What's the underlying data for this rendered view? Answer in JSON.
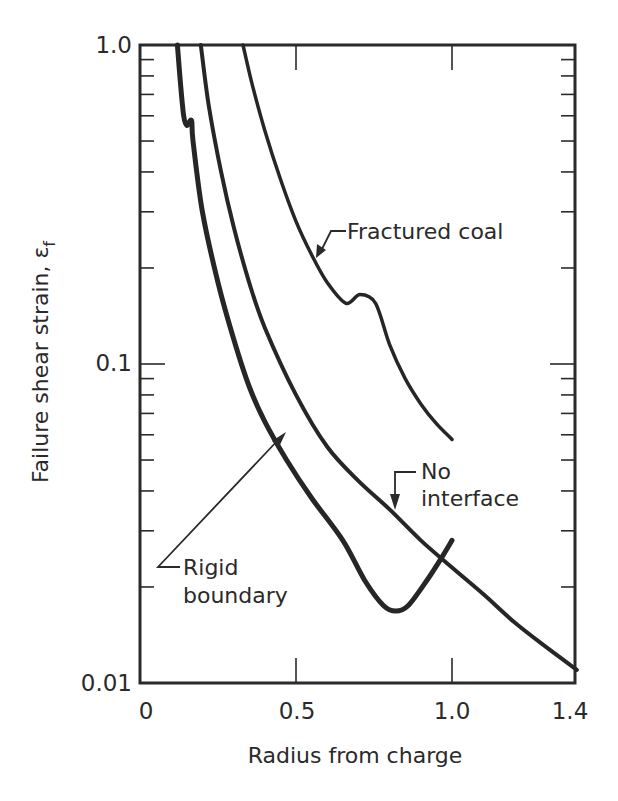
{
  "chart_data": {
    "type": "line",
    "title": "",
    "xlabel": "Radius from charge",
    "ylabel": "Failure shear strain, ε",
    "ylabel_subscript": "f",
    "xscale": "linear",
    "yscale": "log",
    "xlim": [
      0,
      1.4
    ],
    "ylim": [
      0.01,
      1.0
    ],
    "x_ticks": [
      {
        "value": 0,
        "label": "0"
      },
      {
        "value": 0.5,
        "label": "0.5"
      },
      {
        "value": 1.0,
        "label": "1.0"
      },
      {
        "value": 1.4,
        "label": "1.4"
      }
    ],
    "y_ticks": [
      {
        "value": 0.01,
        "label": "0.01"
      },
      {
        "value": 0.1,
        "label": "0.1"
      },
      {
        "value": 1.0,
        "label": "1.0"
      }
    ],
    "grid": false,
    "legend": "none (curves labeled directly)",
    "series": [
      {
        "name": "Rigid boundary",
        "stroke_width": 5,
        "points": [
          [
            0.12,
            1.0
          ],
          [
            0.13,
            0.75
          ],
          [
            0.14,
            0.6
          ],
          [
            0.15,
            0.56
          ],
          [
            0.165,
            0.58
          ],
          [
            0.17,
            0.5
          ],
          [
            0.2,
            0.3
          ],
          [
            0.25,
            0.18
          ],
          [
            0.3,
            0.12
          ],
          [
            0.35,
            0.085
          ],
          [
            0.4,
            0.066
          ],
          [
            0.47,
            0.05
          ],
          [
            0.55,
            0.038
          ],
          [
            0.65,
            0.028
          ],
          [
            0.72,
            0.021
          ],
          [
            0.78,
            0.0175
          ],
          [
            0.82,
            0.0168
          ],
          [
            0.86,
            0.0175
          ],
          [
            0.92,
            0.021
          ],
          [
            0.97,
            0.025
          ],
          [
            1.0,
            0.028
          ]
        ]
      },
      {
        "name": "No interface",
        "stroke_width": 4,
        "points": [
          [
            0.195,
            1.0
          ],
          [
            0.22,
            0.65
          ],
          [
            0.26,
            0.4
          ],
          [
            0.3,
            0.27
          ],
          [
            0.35,
            0.18
          ],
          [
            0.4,
            0.13
          ],
          [
            0.5,
            0.08
          ],
          [
            0.6,
            0.055
          ],
          [
            0.7,
            0.043
          ],
          [
            0.8,
            0.035
          ],
          [
            0.9,
            0.028
          ],
          [
            1.0,
            0.023
          ],
          [
            1.1,
            0.019
          ],
          [
            1.2,
            0.0155
          ],
          [
            1.3,
            0.013
          ],
          [
            1.4,
            0.011
          ]
        ]
      },
      {
        "name": "Fractured coal",
        "stroke_width": 3.5,
        "points": [
          [
            0.33,
            1.0
          ],
          [
            0.36,
            0.75
          ],
          [
            0.4,
            0.54
          ],
          [
            0.45,
            0.38
          ],
          [
            0.5,
            0.28
          ],
          [
            0.55,
            0.22
          ],
          [
            0.6,
            0.18
          ],
          [
            0.66,
            0.155
          ],
          [
            0.705,
            0.165
          ],
          [
            0.755,
            0.155
          ],
          [
            0.8,
            0.115
          ],
          [
            0.85,
            0.09
          ],
          [
            0.9,
            0.075
          ],
          [
            0.95,
            0.065
          ],
          [
            1.0,
            0.058
          ]
        ]
      }
    ],
    "annotations": [
      {
        "text": "Fractured coal",
        "target_series": "Fractured coal",
        "arrow_to": [
          0.565,
          0.215
        ]
      },
      {
        "text": "No interface",
        "lines": [
          "No",
          "interface"
        ],
        "target_series": "No interface",
        "arrow_to": [
          0.82,
          0.034
        ]
      },
      {
        "text": "Rigid boundary",
        "lines": [
          "Rigid",
          "boundary"
        ],
        "target_series": "Rigid boundary",
        "arrow_to": [
          0.47,
          0.058
        ]
      }
    ]
  },
  "labels": {
    "x_axis_title": "Radius from charge",
    "y_axis_title": "Failure shear strain, ε",
    "y_axis_subscript": "f",
    "fractured_coal": "Fractured coal",
    "no_interface_line1": "No",
    "no_interface_line2": "interface",
    "rigid_boundary_line1": "Rigid",
    "rigid_boundary_line2": "boundary",
    "xtick_0": "0",
    "xtick_05": "0.5",
    "xtick_10": "1.0",
    "xtick_14": "1.4",
    "ytick_001": "0.01",
    "ytick_01": "0.1",
    "ytick_10": "1.0"
  }
}
